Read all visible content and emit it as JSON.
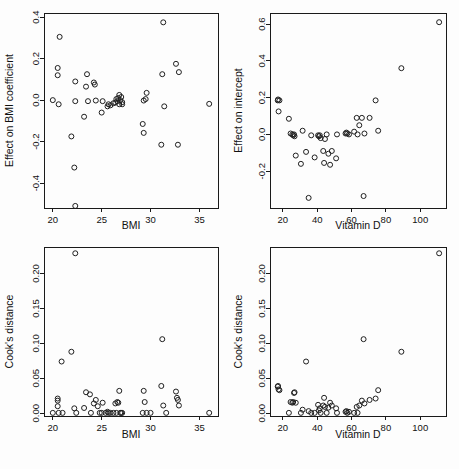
{
  "figure": {
    "layout": "2x2 grid of diagnostic scatter plots",
    "background_color": "#fdfdfd",
    "point_color": "#1f1f1f",
    "axis_color": "#1a1a1a",
    "point_symbol": "open-circle"
  },
  "chart_data": [
    {
      "id": "panel-top-left",
      "type": "scatter",
      "title": "",
      "xlabel": "BMI",
      "ylabel": "Effect on BMI coefficient",
      "xlim": [
        19.1,
        36.9
      ],
      "ylim": [
        -0.52,
        0.42
      ],
      "xticks": [
        20,
        25,
        30,
        35
      ],
      "xticklabels": [
        "20",
        "25",
        "30",
        "35"
      ],
      "yticks": [
        -0.4,
        -0.2,
        0.0,
        0.2,
        0.4
      ],
      "yticklabels": [
        "-0.4",
        "-0.2",
        "0.0",
        "0.2",
        "0.4"
      ],
      "grid": false,
      "legend": null,
      "x": [
        20.0,
        20.5,
        20.5,
        20.6,
        20.7,
        21.9,
        22.2,
        22.3,
        22.3,
        23.2,
        23.4,
        23.5,
        23.6,
        24.2,
        24.3,
        24.4,
        25.0,
        25.1,
        25.6,
        25.7,
        25.9,
        26.2,
        26.4,
        26.5,
        26.6,
        26.7,
        26.8,
        26.8,
        26.9,
        27.0,
        27.1,
        27.1,
        29.2,
        29.3,
        29.3,
        29.5,
        29.6,
        31.1,
        31.2,
        31.3,
        31.4,
        32.6,
        32.8,
        32.9,
        36.0
      ],
      "y": [
        0.0,
        0.155,
        0.12,
        -0.02,
        0.305,
        -0.175,
        -0.325,
        0.09,
        -0.005,
        -0.08,
        0.065,
        0.125,
        -0.005,
        0.085,
        0.075,
        -0.002,
        -0.06,
        -0.005,
        -0.03,
        -0.02,
        -0.025,
        -0.015,
        -0.012,
        0.005,
        -0.005,
        0.01,
        0.025,
        -0.02,
        0.0,
        0.015,
        -0.02,
        -0.01,
        -0.115,
        -0.158,
        -0.002,
        0.005,
        0.035,
        -0.215,
        0.125,
        0.375,
        -0.03,
        0.175,
        -0.215,
        0.135,
        -0.018
      ],
      "extra_points": [
        {
          "x": 22.3,
          "y": -0.51
        }
      ]
    },
    {
      "id": "panel-top-right",
      "type": "scatter",
      "title": "",
      "xlabel": "Vitamin D",
      "ylabel": "Effect on intercept",
      "xlim": [
        12.5,
        115.0
      ],
      "ylim": [
        -0.4,
        0.66
      ],
      "xticks": [
        20,
        40,
        60,
        80,
        100
      ],
      "xticklabels": [
        "20",
        "40",
        "60",
        "80",
        "100"
      ],
      "yticks": [
        -0.2,
        0.0,
        0.2,
        0.4,
        0.6
      ],
      "yticklabels": [
        "-0.2",
        "0.0",
        "0.2",
        "0.4",
        "0.6"
      ],
      "grid": false,
      "legend": null,
      "x": [
        17.0,
        17.2,
        17.5,
        18.0,
        23.5,
        24.5,
        25.5,
        26.0,
        26.5,
        26.8,
        27.5,
        30.5,
        31.5,
        33.5,
        35.0,
        36.5,
        38.5,
        40.5,
        41.0,
        41.5,
        42.0,
        43.5,
        44.0,
        44.5,
        45.5,
        46.5,
        47.5,
        48.5,
        51.0,
        51.5,
        56.5,
        57.0,
        57.5,
        58.5,
        61.5,
        63.0,
        63.5,
        64.5,
        66.0,
        67.0,
        67.5,
        70.5,
        74.0,
        75.5,
        89.0,
        111.0
      ],
      "y": [
        0.185,
        0.19,
        0.125,
        0.185,
        0.085,
        0.005,
        0.0,
        -0.005,
        0.0,
        -0.01,
        -0.115,
        -0.16,
        0.02,
        -0.095,
        -0.345,
        -0.005,
        -0.125,
        -0.005,
        -0.01,
        -0.005,
        -0.02,
        -0.09,
        -0.155,
        -0.025,
        0.0,
        -0.105,
        -0.165,
        -0.09,
        -0.13,
        0.0,
        0.005,
        0.01,
        0.005,
        0.0,
        0.015,
        0.09,
        0.0,
        0.05,
        0.09,
        -0.335,
        0.005,
        0.09,
        0.185,
        0.02,
        0.36,
        0.61
      ]
    },
    {
      "id": "panel-bottom-left",
      "type": "scatter",
      "title": "",
      "xlabel": "BMI",
      "ylabel": "Cook's distance",
      "xlim": [
        19.1,
        36.9
      ],
      "ylim": [
        -0.004,
        0.238
      ],
      "xticks": [
        20,
        25,
        30,
        35
      ],
      "xticklabels": [
        "20",
        "25",
        "30",
        "35"
      ],
      "yticks": [
        0.0,
        0.05,
        0.1,
        0.15,
        0.2
      ],
      "yticklabels": [
        "0.00",
        "0.05",
        "0.10",
        "0.15",
        "0.20"
      ],
      "grid": false,
      "legend": null,
      "x": [
        20.0,
        20.5,
        20.5,
        20.5,
        20.6,
        20.9,
        21.0,
        21.9,
        22.2,
        22.3,
        22.4,
        23.2,
        23.4,
        23.8,
        23.9,
        24.2,
        24.4,
        24.6,
        24.8,
        25.0,
        25.1,
        25.4,
        25.6,
        25.7,
        25.9,
        26.2,
        26.4,
        26.5,
        26.6,
        26.7,
        26.8,
        26.9,
        27.0,
        27.1,
        29.2,
        29.3,
        29.4,
        29.6,
        30.0,
        31.1,
        31.2,
        31.3,
        31.6,
        32.6,
        32.7,
        32.8,
        32.9,
        36.0
      ],
      "y": [
        0.0005,
        0.018,
        0.021,
        0.01,
        0.0005,
        0.074,
        0.0005,
        0.088,
        0.007,
        0.229,
        0.0005,
        0.0075,
        0.03,
        0.027,
        0.0005,
        0.014,
        0.019,
        0.01,
        0.0005,
        0.0005,
        0.015,
        0.0005,
        0.002,
        0.0005,
        0.0005,
        0.0005,
        0.014,
        0.0005,
        0.016,
        0.015,
        0.032,
        0.0005,
        0.0005,
        0.0005,
        0.0005,
        0.032,
        0.016,
        0.0005,
        0.0005,
        0.039,
        0.106,
        0.011,
        0.0005,
        0.031,
        0.022,
        0.019,
        0.011,
        0.0005
      ]
    },
    {
      "id": "panel-bottom-right",
      "type": "scatter",
      "title": "",
      "xlabel": "Vitamin D",
      "ylabel": "Cook's distance",
      "xlim": [
        12.5,
        115.0
      ],
      "ylim": [
        -0.004,
        0.238
      ],
      "xticks": [
        20,
        40,
        60,
        80,
        100
      ],
      "xticklabels": [
        "20",
        "40",
        "60",
        "80",
        "100"
      ],
      "yticks": [
        0.0,
        0.05,
        0.1,
        0.15,
        0.2
      ],
      "yticklabels": [
        "0.00",
        "0.05",
        "0.10",
        "0.15",
        "0.20"
      ],
      "grid": false,
      "legend": null,
      "x": [
        17.0,
        17.2,
        17.5,
        18.0,
        23.5,
        24.5,
        25.5,
        26.0,
        26.5,
        26.8,
        27.5,
        30.5,
        31.5,
        33.5,
        35.0,
        36.5,
        38.5,
        40.5,
        41.0,
        41.5,
        42.0,
        43.5,
        44.0,
        44.5,
        45.5,
        46.5,
        47.5,
        48.5,
        51.0,
        51.5,
        56.5,
        57.0,
        57.5,
        58.5,
        61.5,
        63.0,
        63.5,
        64.5,
        66.0,
        67.0,
        67.5,
        70.5,
        74.0,
        75.5,
        89.0,
        111.0
      ],
      "y": [
        0.038,
        0.039,
        0.034,
        0.033,
        0.0005,
        0.016,
        0.015,
        0.016,
        0.029,
        0.03,
        0.015,
        0.0005,
        0.005,
        0.074,
        0.003,
        0.0005,
        0.0005,
        0.012,
        0.004,
        0.007,
        0.0005,
        0.011,
        0.022,
        0.009,
        0.0005,
        0.008,
        0.015,
        0.011,
        0.007,
        0.0005,
        0.002,
        0.003,
        0.0005,
        0.002,
        0.0005,
        0.009,
        0.0005,
        0.011,
        0.018,
        0.106,
        0.014,
        0.019,
        0.021,
        0.033,
        0.088,
        0.229
      ]
    }
  ]
}
